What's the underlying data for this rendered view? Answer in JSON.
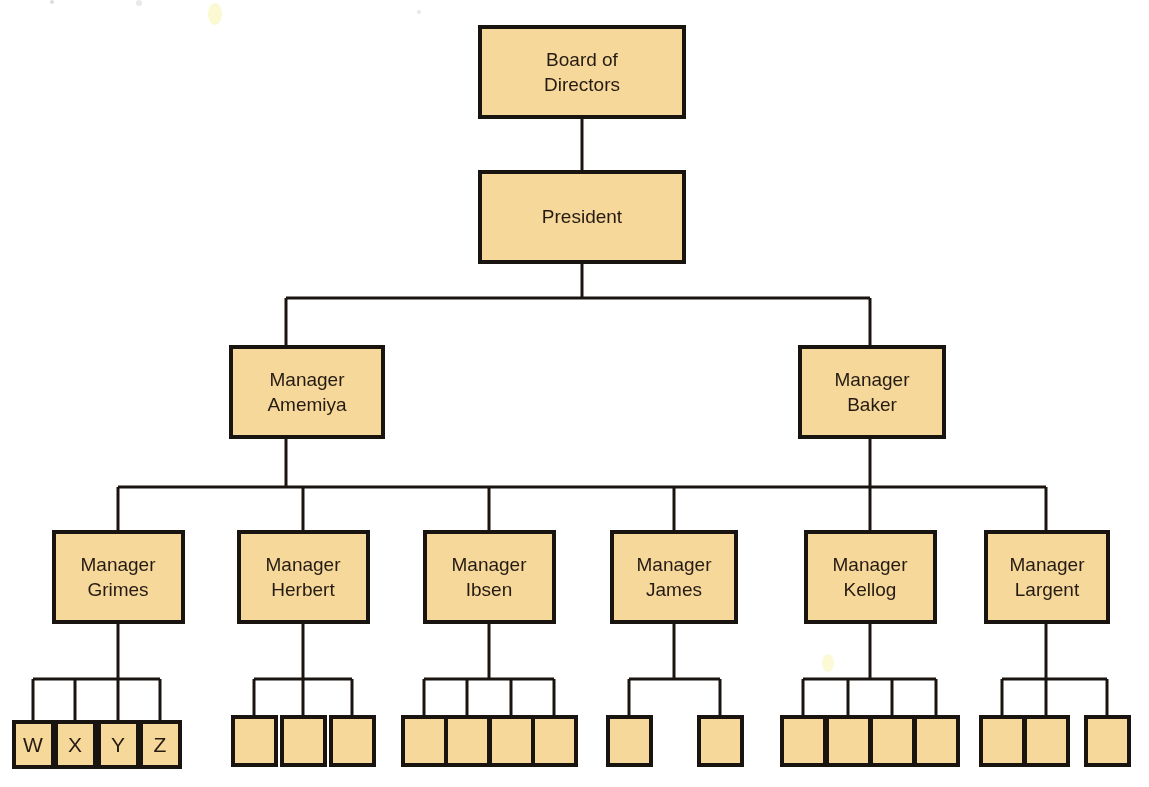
{
  "diagram": {
    "type": "organizational-chart",
    "background_color": "#FFFFFF",
    "box_fill_color": "#F7D89B",
    "box_border_color": "#1A1410",
    "connector_color": "#1A1410",
    "text_color": "#241B12",
    "levels": 4
  },
  "nodes": {
    "board": {
      "label_line1": "Board of",
      "label_line2": "Directors"
    },
    "president": {
      "label_line1": "President",
      "label_line2": ""
    },
    "amemiya": {
      "label_line1": "Manager",
      "label_line2": "Amemiya"
    },
    "baker": {
      "label_line1": "Manager",
      "label_line2": "Baker"
    },
    "grimes": {
      "label_line1": "Manager",
      "label_line2": "Grimes"
    },
    "herbert": {
      "label_line1": "Manager",
      "label_line2": "Herbert"
    },
    "ibsen": {
      "label_line1": "Manager",
      "label_line2": "Ibsen"
    },
    "james": {
      "label_line1": "Manager",
      "label_line2": "James"
    },
    "kellog": {
      "label_line1": "Manager",
      "label_line2": "Kellog"
    },
    "largent": {
      "label_line1": "Manager",
      "label_line2": "Largent"
    }
  },
  "leaves": {
    "grimes_children": [
      "W",
      "X",
      "Y",
      "Z"
    ],
    "herbert_children": [
      "",
      "",
      ""
    ],
    "ibsen_children": [
      "",
      "",
      "",
      ""
    ],
    "james_children": [
      "",
      ""
    ],
    "kellog_children": [
      "",
      "",
      "",
      ""
    ],
    "largent_children": [
      "",
      "",
      ""
    ]
  },
  "hierarchy": {
    "root": "Board of Directors",
    "edges": [
      {
        "from": "Board of Directors",
        "to": "President"
      },
      {
        "from": "President",
        "to": "Manager Amemiya"
      },
      {
        "from": "President",
        "to": "Manager Baker"
      },
      {
        "from": "Manager Amemiya",
        "to": "Manager Grimes"
      },
      {
        "from": "Manager Amemiya",
        "to": "Manager Herbert"
      },
      {
        "from": "Manager Amemiya",
        "to": "Manager Ibsen"
      },
      {
        "from": "Manager Baker",
        "to": "Manager James"
      },
      {
        "from": "Manager Baker",
        "to": "Manager Kellog"
      },
      {
        "from": "Manager Baker",
        "to": "Manager Largent"
      },
      {
        "from": "Manager Grimes",
        "to": "W"
      },
      {
        "from": "Manager Grimes",
        "to": "X"
      },
      {
        "from": "Manager Grimes",
        "to": "Y"
      },
      {
        "from": "Manager Grimes",
        "to": "Z"
      }
    ],
    "leaf_counts": {
      "Manager Grimes": 4,
      "Manager Herbert": 3,
      "Manager Ibsen": 4,
      "Manager James": 2,
      "Manager Kellog": 4,
      "Manager Largent": 3
    }
  }
}
